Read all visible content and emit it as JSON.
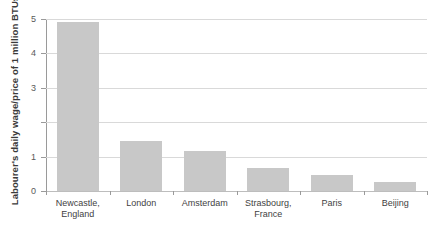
{
  "chart_data": {
    "type": "bar",
    "title": "",
    "xlabel": "",
    "ylabel": "Labourer's daily wage/price of 1 million BTUs",
    "categories": [
      "Newcastle, England",
      "London",
      "Amsterdam",
      "Strasbourg, France",
      "Paris",
      "Beijing"
    ],
    "category_lines": [
      [
        "Newcastle,",
        "England"
      ],
      [
        "London",
        ""
      ],
      [
        "Amsterdam",
        ""
      ],
      [
        "Strasbourg,",
        "France"
      ],
      [
        "Paris",
        ""
      ],
      [
        "Beijing",
        ""
      ]
    ],
    "values": [
      4.92,
      1.45,
      1.17,
      0.68,
      0.48,
      0.25
    ],
    "ylim": [
      0,
      5
    ],
    "ytick_values": [
      0,
      1,
      2,
      3,
      4,
      5
    ],
    "ytick_labels": [
      "0",
      "1",
      "",
      "3",
      "4",
      "5"
    ],
    "grid": true,
    "grid_axis": "y",
    "legend": false,
    "bar_color": "#c8c8c8",
    "gridline_color": "#d9d9d9",
    "axis_color": "#9a9a9a"
  }
}
